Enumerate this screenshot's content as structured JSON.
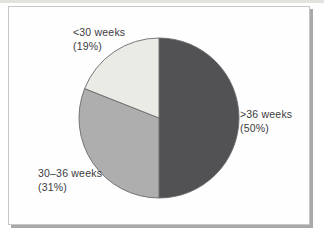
{
  "chart_data": {
    "type": "pie",
    "start_angle_deg": 0,
    "direction": "clockwise",
    "outline_color": "#6a6a6c",
    "slices": [
      {
        "label": ">36 weeks",
        "value": 50,
        "pct_label": "(50%)",
        "color": "#525254"
      },
      {
        "label": "30–36 weeks",
        "value": 31,
        "pct_label": "(31%)",
        "color": "#aeaeae"
      },
      {
        "label": "<30 weeks",
        "value": 19,
        "pct_label": "(19%)",
        "color": "#ebebe6"
      }
    ]
  }
}
